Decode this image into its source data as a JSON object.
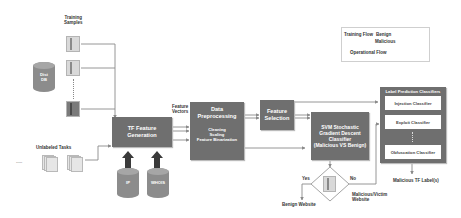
{
  "diagram": {
    "left": {
      "training_samples_label": "Training\nSamples",
      "unlabeled_tasks_label": "Unlabeled Tasks",
      "database_label": "Dist\nDB",
      "ellipsis": "....."
    },
    "nodes": {
      "tf_feature_generation": "TF Feature\nGeneration",
      "feature_vectors_label": "Feature\nVectors",
      "data_preprocessing": {
        "title": "Data\nPreprocessing",
        "steps": "Cleaning\nScaling\nFeature Binarization"
      },
      "feature_selection": "Feature\nSelection",
      "svm_classifier": "SVM Stochastic\nGradient Descent\nClassifier\n(Malicious VS Benign)",
      "ip_db": "IP",
      "whois_db": "WHOIS"
    },
    "decision": {
      "yes_label": "Yes",
      "no_label": "No",
      "benign_output": "Benign Website",
      "malicious_output": "Malicious/Victim\nWebsite"
    },
    "classifiers": {
      "title": "Label Prediction Classifiers",
      "items": [
        "Injection Classifier",
        "Exploit Classifier",
        "Obfuscation Classifier"
      ],
      "output": "Malicious TF Label(s)"
    },
    "legend": {
      "training_flow": "Training Flow",
      "benign": "Benign",
      "malicious": "Malicious",
      "operational_flow": "Operational Flow"
    },
    "colors": {
      "box_fill": "#6f6f6f",
      "line": "#8a8a8a",
      "arrow_dark": "#3a3a3a",
      "cylinder": "#8c8c8c"
    }
  }
}
